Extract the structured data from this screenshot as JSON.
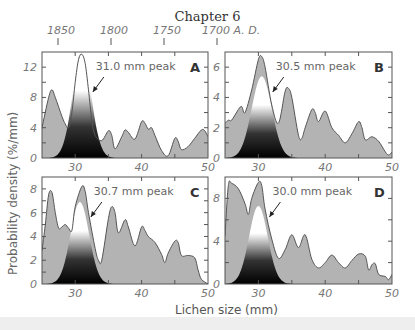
{
  "page": {
    "header": "Chapter 6",
    "top_axis": {
      "labels": [
        "1850",
        "1800",
        "1750",
        "1700 A. D."
      ],
      "positions_px": [
        58,
        111,
        164,
        217
      ]
    },
    "y_axis_label": "Probability density (%/mm)",
    "x_axis_label": "Lichen size (mm)"
  },
  "chart_data": [
    {
      "panel": "A",
      "type": "area",
      "annotation": "31.0 mm peak",
      "xlim": [
        25,
        50
      ],
      "ylim": [
        0,
        14
      ],
      "xticks": [
        30,
        40,
        50
      ],
      "yticks": [
        0,
        4,
        8,
        12
      ],
      "x": [
        25,
        26,
        26.5,
        27,
        28,
        28.5,
        29,
        29.5,
        30,
        30.5,
        31,
        31.5,
        32,
        32.5,
        33,
        34,
        35,
        35.5,
        36,
        37,
        37.5,
        38,
        39,
        40,
        40.5,
        41,
        41.5,
        42,
        43,
        44,
        45,
        45.5,
        46,
        47,
        48,
        49,
        49.5,
        50
      ],
      "values": [
        4,
        8,
        9,
        8,
        5.5,
        4.5,
        4,
        6,
        10,
        13,
        13.7,
        12.5,
        9,
        5,
        3,
        2.3,
        3.6,
        3,
        1.2,
        2.8,
        3.7,
        3.4,
        2.5,
        4.8,
        4.6,
        3.8,
        4,
        3,
        1,
        0.3,
        2.6,
        2.2,
        1.1,
        1.5,
        2.6,
        3.7,
        3.6,
        2.8
      ],
      "highlight_peak": {
        "center": 31.0,
        "height": 13.7,
        "sd": 1.4
      }
    },
    {
      "panel": "B",
      "type": "area",
      "annotation": "30.5 mm peak",
      "xlim": [
        25,
        50
      ],
      "ylim": [
        0,
        7
      ],
      "xticks": [
        30,
        40,
        50
      ],
      "yticks": [
        0,
        2,
        4,
        6
      ],
      "x": [
        25,
        25.5,
        26,
        27,
        27.5,
        28,
        29,
        30,
        30.5,
        31,
        32,
        33,
        34,
        34.5,
        35,
        36,
        36.5,
        37,
        38,
        38.5,
        39,
        40,
        41,
        42,
        43,
        44,
        45,
        45.5,
        46,
        47,
        48,
        49,
        49.5,
        50
      ],
      "values": [
        2.3,
        2.5,
        2.5,
        3.2,
        3.4,
        3,
        4.5,
        6.5,
        6.7,
        6,
        3.5,
        2.3,
        4.4,
        4.6,
        4,
        1.5,
        1.3,
        2,
        3.2,
        3,
        2.4,
        3.1,
        2,
        1.5,
        1,
        1.6,
        2.4,
        2,
        1.2,
        1.4,
        1.1,
        0.4,
        0.2,
        0.4
      ],
      "highlight_peak": {
        "center": 30.5,
        "height": 5.4,
        "sd": 1.5
      }
    },
    {
      "panel": "C",
      "type": "area",
      "annotation": "30.7 mm peak",
      "xlim": [
        25,
        50
      ],
      "ylim": [
        0,
        9
      ],
      "xticks": [
        30,
        40,
        50
      ],
      "yticks": [
        0,
        2,
        4,
        6,
        8
      ],
      "x": [
        25,
        25.5,
        26,
        26.5,
        27,
        27.5,
        28,
        28.5,
        29,
        29.5,
        30,
        31,
        31.5,
        32,
        33,
        33.5,
        34,
        35,
        35.5,
        36,
        36.5,
        37.5,
        38,
        39,
        40,
        40.5,
        41,
        42,
        43,
        43.5,
        44,
        45,
        45.5,
        46,
        47,
        48,
        48.5,
        49,
        50
      ],
      "values": [
        2.8,
        5,
        7.5,
        7.7,
        6,
        4.7,
        4.8,
        5,
        4.7,
        4.5,
        6.5,
        8.2,
        7.8,
        6,
        3,
        2,
        2,
        5.5,
        6.5,
        6,
        4.3,
        5.4,
        4.8,
        3.2,
        4.8,
        4.5,
        4,
        3.5,
        2.5,
        1.8,
        2.6,
        3.6,
        3.5,
        2.4,
        2.4,
        2.2,
        1.2,
        0.4,
        0
      ],
      "highlight_peak": {
        "center": 30.7,
        "height": 6.9,
        "sd": 1.4
      }
    },
    {
      "panel": "D",
      "type": "area",
      "annotation": "30.0 mm peak",
      "xlim": [
        25,
        50
      ],
      "ylim": [
        0,
        10
      ],
      "xticks": [
        30,
        40,
        50
      ],
      "yticks": [
        0,
        4,
        8
      ],
      "x": [
        25,
        25.5,
        26,
        27,
        28,
        28.5,
        29,
        30,
        30.5,
        31,
        32,
        33,
        34,
        35,
        36,
        37,
        38,
        39,
        40,
        41,
        42,
        43,
        44,
        45,
        46,
        46.5,
        47,
        47.5,
        48,
        49,
        49.5,
        50
      ],
      "values": [
        4.5,
        9.2,
        9.4,
        8.9,
        7.5,
        6.5,
        8,
        9.5,
        9.2,
        7,
        4.2,
        2.4,
        3.2,
        4.6,
        3.4,
        4.6,
        2.3,
        1.5,
        2,
        2.7,
        2,
        1.5,
        2.2,
        2.8,
        2.6,
        1.3,
        1.8,
        1.9,
        0.9,
        0.7,
        0.4,
        0.9
      ],
      "highlight_peak": {
        "center": 30.0,
        "height": 7.3,
        "sd": 1.4
      }
    }
  ],
  "colors": {
    "fill": "#b3b3b3",
    "stroke": "#555555",
    "axis": "#555555",
    "tick_text": "#777777",
    "peak_dark": "#000000",
    "peak_light": "#ffffff"
  }
}
